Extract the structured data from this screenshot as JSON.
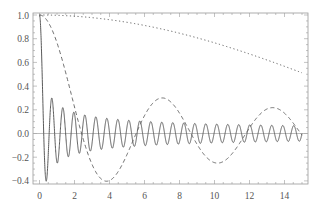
{
  "chart_data": {
    "type": "line",
    "title": "",
    "xlabel": "",
    "ylabel": "",
    "xlim": [
      0,
      15
    ],
    "ylim": [
      -0.43,
      1.0
    ],
    "x_ticks": [
      "0",
      "2",
      "4",
      "6",
      "8",
      "10",
      "12",
      "14"
    ],
    "x_tick_values": [
      0,
      2,
      4,
      6,
      8,
      10,
      12,
      14
    ],
    "y_ticks": [
      "-0.4",
      "-0.2",
      "0.0",
      "0.2",
      "0.4",
      "0.6",
      "0.8",
      "1.0"
    ],
    "y_tick_values": [
      -0.4,
      -0.2,
      0.0,
      0.2,
      0.4,
      0.6,
      0.8,
      1.0
    ],
    "grid": false,
    "frame": true,
    "legend": null,
    "x": [
      0,
      1,
      2,
      3,
      4,
      5,
      6,
      7,
      8,
      9,
      10,
      11,
      12,
      13,
      14,
      15
    ],
    "series": [
      {
        "name": "J0(10x)",
        "style": "solid",
        "function": {
          "type": "besselJ0",
          "scale": 10
        },
        "values": [
          1.0,
          -0.2459,
          0.167,
          -0.0864,
          0.0074,
          0.0558,
          0.0915,
          0.0951,
          0.0643,
          0.012,
          0.02,
          -0.0466,
          -0.0658,
          -0.0669,
          -0.052,
          -0.0265
        ]
      },
      {
        "name": "J0(x)",
        "style": "dashed",
        "function": {
          "type": "besselJ0",
          "scale": 1
        },
        "values": [
          1.0,
          0.7652,
          0.2239,
          -0.2601,
          -0.3971,
          -0.1776,
          0.1506,
          0.3001,
          0.1717,
          -0.0903,
          -0.2459,
          -0.1712,
          0.0477,
          0.2069,
          0.1711,
          -0.0142
        ]
      },
      {
        "name": "J0(x/10)",
        "style": "dotted",
        "function": {
          "type": "besselJ0",
          "scale": 0.1
        },
        "values": [
          1.0,
          0.9975,
          0.99,
          0.9776,
          0.9604,
          0.9385,
          0.912,
          0.8812,
          0.8463,
          0.8075,
          0.7652,
          0.7196,
          0.6711,
          0.6201,
          0.5669,
          0.5118
        ]
      }
    ],
    "colors": {
      "curve": "#5a5a5a",
      "frame": "#9a9a9a",
      "axis": "#aaaaaa",
      "label": "#555555"
    },
    "layout": {
      "plot_left": 33,
      "plot_right": 308,
      "plot_top": 13,
      "plot_bottom": 184,
      "x0_px": 39.5,
      "px_per_x": 17.5,
      "y0_px": 133.5,
      "px_per_y": 118.5
    }
  }
}
